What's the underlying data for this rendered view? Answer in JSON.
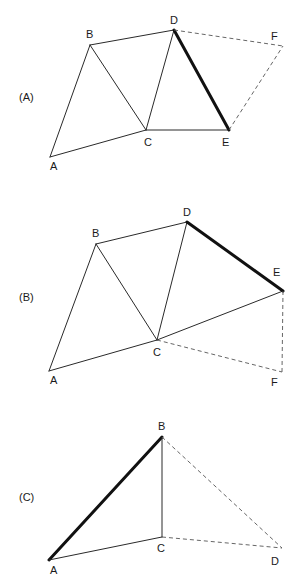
{
  "panels": [
    {
      "id": "A",
      "label": "(A)",
      "label_pos": [
        19,
        101
      ],
      "points": {
        "A": {
          "x": 50,
          "y": 157,
          "label": "A",
          "lx": 50,
          "ly": 170
        },
        "B": {
          "x": 90,
          "y": 45,
          "label": "B",
          "lx": 86,
          "ly": 38
        },
        "C": {
          "x": 146,
          "y": 130,
          "label": "C",
          "lx": 144,
          "ly": 146
        },
        "D": {
          "x": 174,
          "y": 30,
          "label": "D",
          "lx": 170,
          "ly": 24
        },
        "E": {
          "x": 229,
          "y": 130,
          "label": "E",
          "lx": 222,
          "ly": 146
        },
        "F": {
          "x": 283,
          "y": 46,
          "label": "F",
          "lx": 271,
          "ly": 40
        }
      },
      "edges": [
        {
          "from": "A",
          "to": "B",
          "style": "solid"
        },
        {
          "from": "A",
          "to": "C",
          "style": "solid"
        },
        {
          "from": "B",
          "to": "C",
          "style": "solid"
        },
        {
          "from": "B",
          "to": "D",
          "style": "solid"
        },
        {
          "from": "C",
          "to": "D",
          "style": "solid"
        },
        {
          "from": "C",
          "to": "E",
          "style": "solid"
        },
        {
          "from": "D",
          "to": "E",
          "style": "bold"
        },
        {
          "from": "D",
          "to": "F",
          "style": "dashed"
        },
        {
          "from": "E",
          "to": "F",
          "style": "dashed"
        }
      ]
    },
    {
      "id": "B",
      "label": "(B)",
      "label_pos": [
        19,
        301
      ],
      "points": {
        "A": {
          "x": 49,
          "y": 371,
          "label": "A",
          "lx": 50,
          "ly": 384
        },
        "B": {
          "x": 96,
          "y": 244,
          "label": "B",
          "lx": 92,
          "ly": 237
        },
        "C": {
          "x": 157,
          "y": 340,
          "label": "C",
          "lx": 153,
          "ly": 356
        },
        "D": {
          "x": 187,
          "y": 222,
          "label": "D",
          "lx": 183,
          "ly": 216
        },
        "E": {
          "x": 283,
          "y": 291,
          "label": "E",
          "lx": 273,
          "ly": 276
        },
        "F": {
          "x": 282,
          "y": 372,
          "label": "F",
          "lx": 271,
          "ly": 386
        }
      },
      "edges": [
        {
          "from": "A",
          "to": "B",
          "style": "solid"
        },
        {
          "from": "A",
          "to": "C",
          "style": "solid"
        },
        {
          "from": "B",
          "to": "C",
          "style": "solid"
        },
        {
          "from": "B",
          "to": "D",
          "style": "solid"
        },
        {
          "from": "C",
          "to": "D",
          "style": "solid"
        },
        {
          "from": "C",
          "to": "E",
          "style": "solid"
        },
        {
          "from": "D",
          "to": "E",
          "style": "bold"
        },
        {
          "from": "C",
          "to": "F",
          "style": "dashed"
        },
        {
          "from": "E",
          "to": "F",
          "style": "dashed"
        }
      ]
    },
    {
      "id": "C",
      "label": "(C)",
      "label_pos": [
        19,
        501
      ],
      "points": {
        "A": {
          "x": 49,
          "y": 560,
          "label": "A",
          "lx": 50,
          "ly": 574
        },
        "B": {
          "x": 162,
          "y": 437,
          "label": "B",
          "lx": 158,
          "ly": 430
        },
        "C": {
          "x": 162,
          "y": 537,
          "label": "C",
          "lx": 157,
          "ly": 552
        },
        "D": {
          "x": 282,
          "y": 548,
          "label": "D",
          "lx": 271,
          "ly": 565
        }
      },
      "edges": [
        {
          "from": "A",
          "to": "B",
          "style": "bold"
        },
        {
          "from": "A",
          "to": "C",
          "style": "solid"
        },
        {
          "from": "B",
          "to": "C",
          "style": "solid"
        },
        {
          "from": "B",
          "to": "D",
          "style": "dashed"
        },
        {
          "from": "C",
          "to": "D",
          "style": "dashed"
        }
      ]
    }
  ],
  "styles": {
    "line_color": "#2a2a2a",
    "bold_color": "#111111",
    "dash_color": "#555555"
  }
}
